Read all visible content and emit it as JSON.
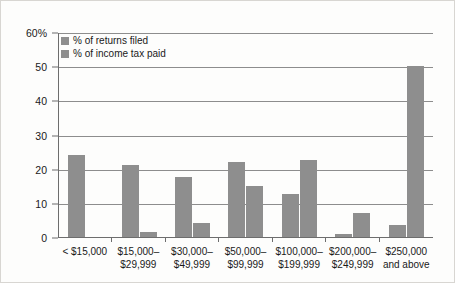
{
  "chart_data": {
    "type": "bar",
    "title": "",
    "subtitle": "",
    "xlabel": "",
    "ylabel": "",
    "ylim": [
      0,
      60
    ],
    "yticks": [
      0,
      10,
      20,
      30,
      40,
      50,
      60
    ],
    "ytick_labels": [
      "0",
      "10",
      "20",
      "30",
      "40",
      "50",
      "60%"
    ],
    "grid": true,
    "legend_position": "top-left",
    "categories": [
      "< $15,000",
      "$15,000–$29,999",
      "$30,000–$49,999",
      "$50,000–$99,999",
      "$100,000–$199,999",
      "$200,000–$249,999",
      "$250,000 and above"
    ],
    "series": [
      {
        "name": "% of returns filed",
        "color": "#8e8e8e",
        "values": [
          24,
          21,
          17.5,
          22,
          12.5,
          1,
          3.5
        ]
      },
      {
        "name": "% of income tax paid",
        "color": "#8e8e8e",
        "values": [
          0,
          1.5,
          4,
          15,
          22.5,
          7,
          50
        ]
      }
    ]
  },
  "axis": {
    "y_labels": [
      "60%",
      "50",
      "40",
      "30",
      "20",
      "10",
      "0"
    ],
    "y_values": [
      60,
      50,
      40,
      30,
      20,
      10,
      0
    ]
  },
  "x_labels": [
    {
      "line1": "< $15,000",
      "line2": ""
    },
    {
      "line1": "$15,000–",
      "line2": "$29,999"
    },
    {
      "line1": "$30,000–",
      "line2": "$49,999"
    },
    {
      "line1": "$50,000–",
      "line2": "$99,999"
    },
    {
      "line1": "$100,000–",
      "line2": "$199,999"
    },
    {
      "line1": "$200,000–",
      "line2": "$249,999"
    },
    {
      "line1": "$250,000",
      "line2": "and above"
    }
  ],
  "legend": {
    "items": [
      {
        "label": "% of returns filed",
        "color": "#8e8e8e"
      },
      {
        "label": "% of income tax paid",
        "color": "#8e8e8e"
      }
    ]
  },
  "colors": {
    "bar": "#8e8e8e",
    "axis": "#6d6d6d",
    "grid": "#8d8d8d",
    "text": "#1a1a1a",
    "background": "#fdfdfc",
    "frame": "#d8d6d2"
  }
}
